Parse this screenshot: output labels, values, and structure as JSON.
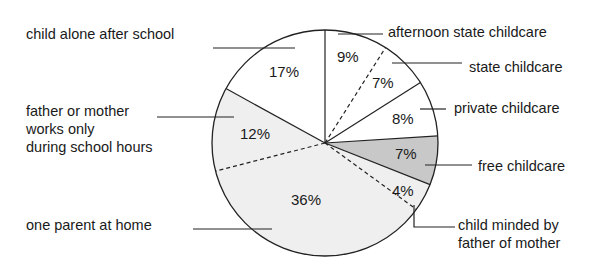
{
  "chart_data": {
    "type": "pie",
    "title": "",
    "slices": [
      {
        "label": "afternoon state childcare",
        "value": 9,
        "pct_label": "9%",
        "fill": "#ffffff",
        "boundary_after": "dashed"
      },
      {
        "label": "state childcare",
        "value": 7,
        "pct_label": "7%",
        "fill": "#ffffff",
        "boundary_after": "solid"
      },
      {
        "label": "private childcare",
        "value": 8,
        "pct_label": "8%",
        "fill": "#ffffff",
        "boundary_after": "solid"
      },
      {
        "label": "free childcare",
        "value": 7,
        "pct_label": "7%",
        "fill": "#c8c8c8",
        "boundary_after": "solid"
      },
      {
        "label": "child minded by father of mother",
        "value": 4,
        "pct_label": "4%",
        "fill": "#efefef",
        "boundary_after": "dashed"
      },
      {
        "label": "one parent at home",
        "value": 36,
        "pct_label": "36%",
        "fill": "#efefef",
        "boundary_after": "dashed"
      },
      {
        "label": "father or mother works only during school hours",
        "value": 12,
        "pct_label": "12%",
        "fill": "#efefef",
        "boundary_after": "solid"
      },
      {
        "label": "child alone after school",
        "value": 17,
        "pct_label": "17%",
        "fill": "#ffffff",
        "boundary_after": "solid"
      }
    ],
    "start_angle_deg": 0,
    "direction": "clockwise",
    "legend": "callout labels with leader lines"
  },
  "labels": {
    "child_alone": "child alone after school",
    "father_mother_1": "father or mother",
    "father_mother_2": "works only",
    "father_mother_3": "during school hours",
    "one_parent": "one parent at home",
    "afternoon_state": "afternoon state childcare",
    "state": "state childcare",
    "private": "private childcare",
    "free": "free childcare",
    "minded_1": "child minded by",
    "minded_2": "father of mother"
  },
  "percents": {
    "afternoon_state": "9%",
    "state": "7%",
    "private": "8%",
    "free": "7%",
    "minded": "4%",
    "one_parent": "36%",
    "father_mother": "12%",
    "child_alone": "17%"
  }
}
